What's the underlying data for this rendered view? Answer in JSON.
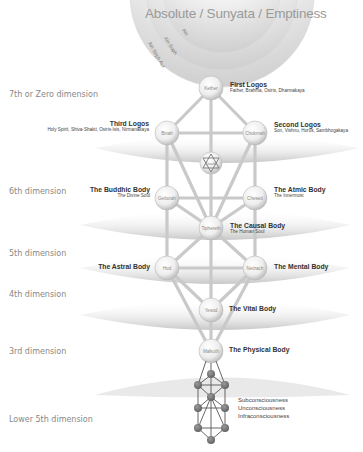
{
  "title": "Absolute / Sunyata / Emptiness",
  "rings": [
    "Ain",
    "Ain Soph",
    "Ain Soph Aur"
  ],
  "dimensions": [
    {
      "label": "7th or Zero dimension",
      "y": 93
    },
    {
      "label": "6th dimension",
      "y": 188
    },
    {
      "label": "5th dimension",
      "y": 250
    },
    {
      "label": "4th dimension",
      "y": 292
    },
    {
      "label": "3rd dimension",
      "y": 349
    },
    {
      "label": "Lower 5th dimension",
      "y": 418
    }
  ],
  "sephiroth": [
    {
      "name": "Kether",
      "cx": 211,
      "cy": 88
    },
    {
      "name": "Binah",
      "cx": 167,
      "cy": 133
    },
    {
      "name": "Chokmah",
      "cx": 255,
      "cy": 133
    },
    {
      "name": "Daath",
      "cx": 211,
      "cy": 163
    },
    {
      "name": "Geburah",
      "cx": 167,
      "cy": 198
    },
    {
      "name": "Chesed",
      "cx": 255,
      "cy": 198
    },
    {
      "name": "Tiphereth",
      "cx": 211,
      "cy": 228
    },
    {
      "name": "Hod",
      "cx": 167,
      "cy": 268
    },
    {
      "name": "Netzach",
      "cx": 255,
      "cy": 268
    },
    {
      "name": "Yesod",
      "cx": 211,
      "cy": 310
    },
    {
      "name": "Malkuth",
      "cx": 211,
      "cy": 351
    }
  ],
  "labels": {
    "first_logos": {
      "main": "First Logos",
      "sub": "Father, Brahma, Osiris, Dharmakaya"
    },
    "second_logos": {
      "main": "Second Logos",
      "sub": "Son, Vishnu, Horus, Sambhogakaya"
    },
    "third_logos": {
      "main": "Third Logos",
      "sub": "Holy Spirit, Shiva-Shakti, Osiris-Isis, Nirmanakaya"
    },
    "buddhic": {
      "main": "The Buddhic Body",
      "sub": "The Divine Soul"
    },
    "atmic": {
      "main": "The Atmic Body",
      "sub": "The Innermost"
    },
    "causal": {
      "main": "The Causal Body",
      "sub": "The Human Soul"
    },
    "astral": {
      "main": "The Astral Body"
    },
    "mental": {
      "main": "The Mental Body"
    },
    "vital": {
      "main": "The Vital Body"
    },
    "physical": {
      "main": "The Physical Body"
    }
  },
  "lower": [
    "Subconsciousness",
    "Unconsciousness",
    "Infraconsciousness"
  ]
}
